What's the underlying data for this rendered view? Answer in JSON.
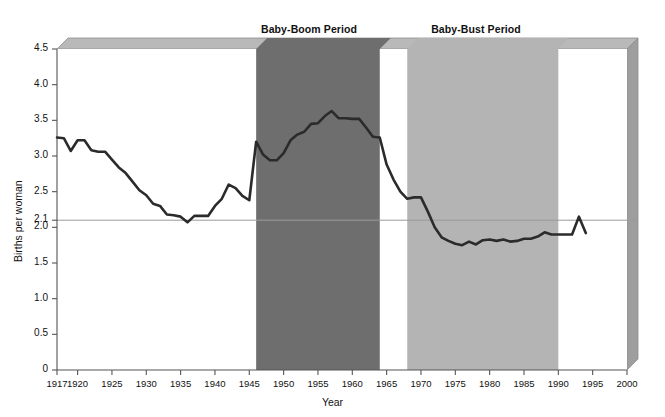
{
  "chart_data": {
    "type": "line",
    "title": "",
    "xlabel": "Year",
    "ylabel": "Births per woman",
    "xlim": [
      1917,
      2000
    ],
    "ylim": [
      0,
      4.5
    ],
    "grid": false,
    "legend_position": "none",
    "x_ticks": [
      "1917",
      "1920",
      "1925",
      "1930",
      "1935",
      "1940",
      "1945",
      "1950",
      "1955",
      "1960",
      "1965",
      "1970",
      "1975",
      "1980",
      "1985",
      "1990",
      "1995",
      "2000"
    ],
    "x_tick_values": [
      1917,
      1920,
      1925,
      1930,
      1935,
      1940,
      1945,
      1950,
      1955,
      1960,
      1965,
      1970,
      1975,
      1980,
      1985,
      1990,
      1995,
      2000
    ],
    "y_ticks": [
      "0",
      "0.5",
      "1.0",
      "1.5",
      "2.0",
      "2.1",
      "2.5",
      "3.0",
      "3.5",
      "4.0",
      "4.5"
    ],
    "y_tick_values": [
      0,
      0.5,
      1.0,
      1.5,
      2.0,
      2.1,
      2.5,
      3.0,
      3.5,
      4.0,
      4.5
    ],
    "series": [
      {
        "name": "Total fertility rate",
        "color": "#2b2b2b",
        "x": [
          1917,
          1918,
          1919,
          1920,
          1921,
          1922,
          1923,
          1924,
          1925,
          1926,
          1927,
          1928,
          1929,
          1930,
          1931,
          1932,
          1933,
          1934,
          1935,
          1936,
          1937,
          1938,
          1939,
          1940,
          1941,
          1942,
          1943,
          1944,
          1945,
          1946,
          1947,
          1948,
          1949,
          1950,
          1951,
          1952,
          1953,
          1954,
          1955,
          1956,
          1957,
          1958,
          1959,
          1960,
          1961,
          1962,
          1963,
          1964,
          1965,
          1966,
          1967,
          1968,
          1969,
          1970,
          1971,
          1972,
          1973,
          1974,
          1975,
          1976,
          1977,
          1978,
          1979,
          1980,
          1981,
          1982,
          1983,
          1984,
          1985,
          1986,
          1987,
          1988,
          1989,
          1990,
          1991,
          1992,
          1993,
          1994
        ],
        "values": [
          3.26,
          3.25,
          3.07,
          3.22,
          3.22,
          3.08,
          3.06,
          3.06,
          2.95,
          2.84,
          2.76,
          2.64,
          2.52,
          2.45,
          2.33,
          2.3,
          2.18,
          2.17,
          2.15,
          2.07,
          2.16,
          2.16,
          2.16,
          2.3,
          2.4,
          2.6,
          2.55,
          2.44,
          2.38,
          3.2,
          3.02,
          2.94,
          2.94,
          3.04,
          3.22,
          3.3,
          3.34,
          3.45,
          3.46,
          3.56,
          3.63,
          3.53,
          3.53,
          3.52,
          3.52,
          3.4,
          3.27,
          3.26,
          2.88,
          2.67,
          2.5,
          2.4,
          2.42,
          2.42,
          2.22,
          2.0,
          1.86,
          1.81,
          1.77,
          1.75,
          1.8,
          1.76,
          1.82,
          1.83,
          1.81,
          1.83,
          1.8,
          1.81,
          1.84,
          1.84,
          1.87,
          1.93,
          1.9,
          1.9,
          1.9,
          1.9,
          2.15,
          1.92
        ]
      }
    ],
    "reference_line": {
      "name": "replacement level",
      "value": 2.1,
      "label_line1": "replacement",
      "label_line2": "level",
      "color": "#9a9a9a"
    },
    "bands": [
      {
        "id": "baby-boom",
        "title_line1": "Baby-Boom Period",
        "title_line2": "(1946–1964)",
        "start": 1946,
        "end": 1964,
        "color": "#6e6e6e"
      },
      {
        "id": "baby-bust",
        "title_line1": "Baby-Bust Period",
        "title_line2": "(1968–?)",
        "start": 1968,
        "end": 1990,
        "color": "#b4b4b4"
      }
    ],
    "colors": {
      "plot_background": "#ffffff",
      "bevel_top": "#b9b9b9",
      "bevel_right": "#9e9e9e",
      "axis": "#555555",
      "line": "#2b2b2b"
    }
  }
}
